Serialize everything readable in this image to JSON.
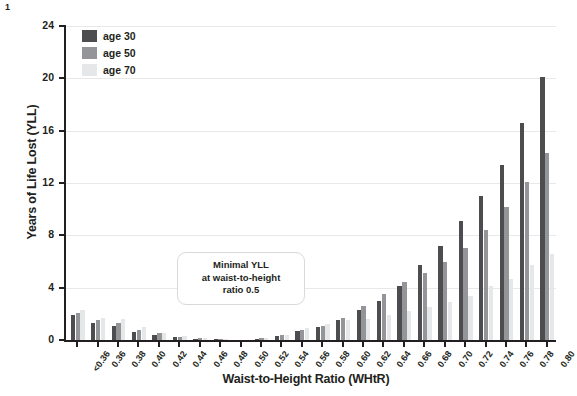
{
  "corner_number": "1",
  "legend": {
    "position": "top-left-inside",
    "items": [
      {
        "label": "age 30",
        "color": "#4d4d4f"
      },
      {
        "label": "age 50",
        "color": "#939598"
      },
      {
        "label": "age 70",
        "color": "#e6e7e8"
      }
    ]
  },
  "annotation": {
    "line1": "Minimal YLL",
    "line2": "at waist-to-height",
    "line3": "ratio 0.5"
  },
  "chart_data": {
    "type": "bar",
    "title": "",
    "xlabel": "Waist-to-Height Ratio (WHtR)",
    "ylabel": "Years of Life Lost (YLL)",
    "ylim": [
      0,
      24
    ],
    "yticks": [
      0,
      4,
      8,
      12,
      16,
      20,
      24
    ],
    "grid": "horizontal",
    "legend_position": "upper left",
    "categories": [
      "<0.36",
      "0.36",
      "0.38",
      "0.40",
      "0.42",
      "0.44",
      "0.46",
      "0.48",
      "0.50",
      "0.52",
      "0.54",
      "0.56",
      "0.58",
      "0.60",
      "0.62",
      "0.64",
      "0.66",
      "0.68",
      "0.70",
      "0.72",
      "0.74",
      "0.76",
      "0.78",
      "0.80"
    ],
    "series": [
      {
        "name": "age 30",
        "color": "#4d4d4f",
        "values": [
          1.9,
          1.3,
          1.1,
          0.6,
          0.4,
          0.2,
          0.1,
          0.05,
          0.0,
          0.1,
          0.3,
          0.7,
          1.0,
          1.5,
          2.3,
          3.0,
          4.1,
          5.7,
          7.2,
          9.1,
          11.0,
          13.4,
          16.6,
          20.1
        ]
      },
      {
        "name": "age 50",
        "color": "#939598",
        "values": [
          2.1,
          1.5,
          1.3,
          0.8,
          0.5,
          0.25,
          0.12,
          0.07,
          0.0,
          0.12,
          0.35,
          0.8,
          1.1,
          1.7,
          2.6,
          3.5,
          4.4,
          5.1,
          6.0,
          7.0,
          8.4,
          10.2,
          12.1,
          14.3
        ]
      },
      {
        "name": "age 70",
        "color": "#e6e7e8",
        "values": [
          2.3,
          1.7,
          1.6,
          1.0,
          0.55,
          0.3,
          0.15,
          0.08,
          0.0,
          0.15,
          0.4,
          0.9,
          1.2,
          1.5,
          1.6,
          1.9,
          2.2,
          2.5,
          2.9,
          3.4,
          4.1,
          4.7,
          5.7,
          6.6
        ]
      }
    ]
  }
}
